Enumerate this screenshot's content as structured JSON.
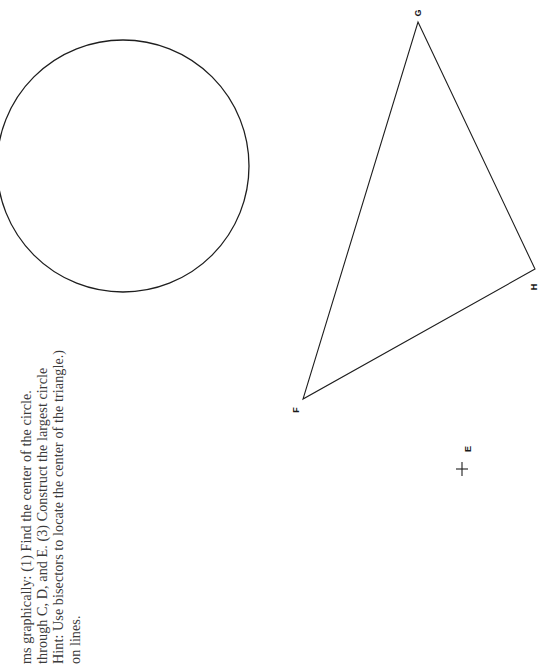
{
  "instructions": {
    "lines": [
      "ms graphically: (1) Find the center of the circle.",
      "through C, D, and E. (3) Construct the largest circle",
      "Hint: Use bisectors to locate the center of the triangle.)",
      "on lines."
    ]
  },
  "figures": {
    "circle": {
      "label": "circle",
      "cx": 123,
      "cy": 166,
      "r": 126
    },
    "triangle": {
      "vertices": [
        {
          "name": "G",
          "x": 418,
          "y": 22
        },
        {
          "name": "H",
          "x": 535,
          "y": 269
        },
        {
          "name": "F",
          "x": 303,
          "y": 399
        }
      ]
    },
    "point_e": {
      "name": "E",
      "x": 462,
      "y": 469
    }
  },
  "labels": {
    "g": "G",
    "h": "H",
    "f": "F",
    "e": "E"
  },
  "colors": {
    "stroke": "#1e1e1e",
    "text": "#3a3a3a",
    "background": "#ffffff"
  }
}
